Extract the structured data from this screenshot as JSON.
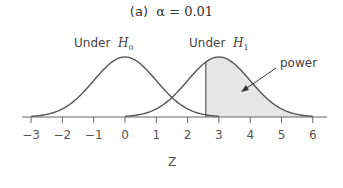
{
  "chart_data": {
    "type": "area",
    "title_prefix": "(a)",
    "title_math": "α = 0.01",
    "xlabel": "Z",
    "ylabel": "",
    "xlim": [
      -3,
      6
    ],
    "xticks": [
      -3,
      -2,
      -1,
      0,
      1,
      2,
      3,
      4,
      5,
      6
    ],
    "grid": false,
    "series": [
      {
        "name": "Under H0",
        "mean": 0,
        "sd": 1
      },
      {
        "name": "Under H1",
        "mean": 3,
        "sd": 1
      }
    ],
    "critical_value": 2.58,
    "shaded_region": {
      "series": "Under H1",
      "from": 2.58,
      "to": 6,
      "label": "power",
      "color": "#e6e6e6"
    },
    "annotations": [
      {
        "text": "Under H0",
        "x": 0
      },
      {
        "text": "Under H1",
        "x": 3
      },
      {
        "text": "power",
        "arrow_to": [
          3.7,
          0.15
        ]
      }
    ]
  },
  "labels": {
    "h0_prefix": "Under",
    "h0_sym": "H",
    "h0_sub": "0",
    "h1_prefix": "Under",
    "h1_sym": "H",
    "h1_sub": "1",
    "power": "power",
    "xlabel": "Z",
    "title_prefix": "(a)",
    "title_math": "α = 0.01"
  }
}
